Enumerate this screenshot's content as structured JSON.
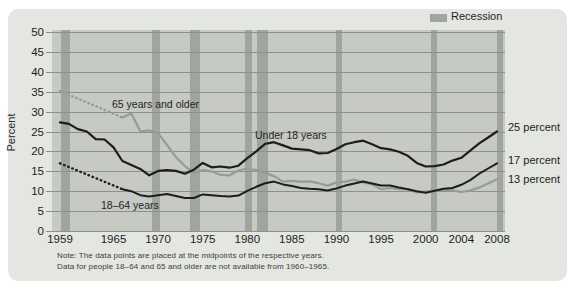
{
  "figure": {
    "legend_label": "Recession",
    "notes": [
      "Note: The data points are placed at the midpoints of the respective years.",
      "Data for people 18–64 and 65 and older are not available from 1960–1965."
    ]
  },
  "chart_data": {
    "type": "line",
    "title": "",
    "xlabel": "",
    "ylabel": "Percent",
    "ylim": [
      0,
      50
    ],
    "x_range": [
      1959,
      2008
    ],
    "grid": "horizontal",
    "legend_position": "top-right",
    "y_ticks": [
      0,
      5,
      10,
      15,
      20,
      25,
      30,
      35,
      40,
      45,
      50
    ],
    "x_tick_labels": [
      1959,
      1965,
      1970,
      1975,
      1980,
      1985,
      1990,
      1995,
      2000,
      2004,
      2008
    ],
    "colors": {
      "plot_bg": "#c6c9c4",
      "recession_band": "#a0a5a0",
      "grid": "#8d918c",
      "black_line": "#1d1d1b",
      "gray_line": "#969c96"
    },
    "recessions": [
      {
        "start": 1959.15,
        "end": 1960.1
      },
      {
        "start": 1969.3,
        "end": 1970.25
      },
      {
        "start": 1973.55,
        "end": 1974.7
      },
      {
        "start": 1979.7,
        "end": 1980.5
      },
      {
        "start": 1981.1,
        "end": 1982.35
      },
      {
        "start": 1990.0,
        "end": 1990.6
      },
      {
        "start": 2000.6,
        "end": 2001.3
      },
      {
        "start": 2008.0,
        "end": 2008.7
      }
    ],
    "series": [
      {
        "id": "under18",
        "name": "Under 18 years",
        "end_label": "25 percent",
        "color_key": "black_line",
        "width": 2.2,
        "start_year": 1959,
        "values": [
          27.3,
          26.9,
          25.6,
          25.0,
          23.1,
          23.0,
          21.0,
          17.6,
          16.6,
          15.6,
          14.0,
          15.1,
          15.3,
          15.1,
          14.4,
          15.4,
          17.1,
          16.0,
          16.2,
          15.9,
          16.4,
          18.3,
          20.0,
          21.9,
          22.3,
          21.5,
          20.7,
          20.5,
          20.3,
          19.5,
          19.6,
          20.6,
          21.8,
          22.3,
          22.7,
          21.8,
          20.8,
          20.5,
          19.9,
          18.9,
          17.1,
          16.2,
          16.3,
          16.7,
          17.7,
          18.4,
          20.2,
          22.0,
          23.5,
          25.0
        ]
      },
      {
        "id": "age18-64",
        "name": "18–64 years",
        "end_label": "17 percent",
        "color_key": "black_line",
        "width": 2.0,
        "dotted_from": {
          "year": 1959,
          "value": 17.0
        },
        "start_year": 1966,
        "values": [
          10.5,
          10.0,
          9.0,
          8.7,
          9.0,
          9.3,
          8.8,
          8.3,
          8.3,
          9.2,
          9.0,
          8.8,
          8.7,
          8.9,
          10.1,
          11.1,
          12.0,
          12.4,
          11.7,
          11.3,
          10.8,
          10.6,
          10.5,
          10.2,
          10.7,
          11.4,
          11.9,
          12.4,
          11.9,
          11.4,
          11.4,
          10.9,
          10.5,
          10.0,
          9.6,
          10.1,
          10.6,
          10.8,
          11.6,
          12.8,
          14.4,
          15.7,
          17.0
        ]
      },
      {
        "id": "age65",
        "name": "65 years and older",
        "end_label": "13 percent",
        "color_key": "gray_line",
        "width": 2.2,
        "dotted_from": {
          "year": 1959,
          "value": 35.2
        },
        "start_year": 1966,
        "values": [
          28.5,
          29.5,
          25.0,
          25.3,
          24.6,
          21.6,
          18.6,
          16.3,
          14.6,
          15.3,
          15.0,
          14.1,
          14.0,
          15.2,
          15.7,
          15.3,
          14.6,
          13.8,
          12.4,
          12.6,
          12.4,
          12.5,
          12.0,
          11.4,
          12.2,
          12.4,
          12.9,
          12.2,
          11.7,
          10.5,
          10.8,
          10.5,
          10.5,
          9.7,
          9.9,
          10.1,
          10.4,
          10.2,
          9.8,
          10.2,
          10.9,
          11.9,
          13.0
        ]
      }
    ]
  }
}
